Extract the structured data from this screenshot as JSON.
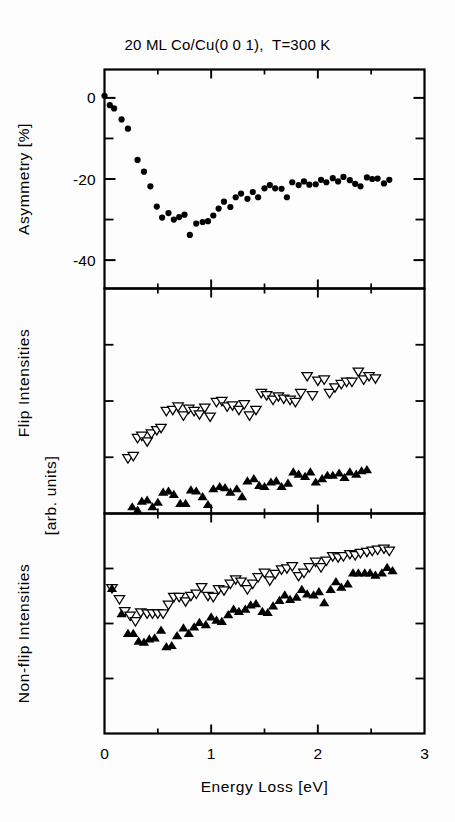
{
  "figure": {
    "title": "20 ML Co/Cu(0 0 1),  T=300 K",
    "xlabel": "Energy Loss [eV]"
  },
  "panels": {
    "top": {
      "ylabel": "Asymmetry [%]"
    },
    "middle": {
      "ylabel": "Flip Intensities"
    },
    "bottom": {
      "ylabel": "Non-flip Intensities",
      "ylabel2": "[arb. units]"
    }
  },
  "axis": {
    "x_ticks": [
      "0",
      "1",
      "2",
      "3"
    ],
    "y_ticks_top": [
      "0",
      "-20",
      "-40"
    ]
  },
  "chart_data": {
    "type": "scatter",
    "title": "20 ML Co/Cu(0 0 1),  T=300 K",
    "xlabel": "Energy Loss [eV]",
    "xlim": [
      0,
      3
    ],
    "xticks": [
      0,
      1,
      2,
      3
    ],
    "xminorticks": [
      0.5,
      1.5,
      2.5
    ],
    "grid": false,
    "legend": false,
    "panels": [
      {
        "name": "asymmetry",
        "ylabel": "Asymmetry [%]",
        "ylim": [
          -47,
          7
        ],
        "yticks": [
          0,
          -20,
          -40
        ],
        "yminorticks": [
          -10,
          -30
        ],
        "series": [
          {
            "name": "asymmetry",
            "marker": "filled-circle",
            "x": [
              0.0,
              0.05,
              0.09,
              0.16,
              0.22,
              0.31,
              0.37,
              0.43,
              0.49,
              0.54,
              0.6,
              0.65,
              0.7,
              0.75,
              0.8,
              0.86,
              0.92,
              0.97,
              1.02,
              1.07,
              1.12,
              1.18,
              1.23,
              1.28,
              1.34,
              1.39,
              1.44,
              1.5,
              1.55,
              1.6,
              1.66,
              1.71,
              1.76,
              1.82,
              1.87,
              1.92,
              1.98,
              2.03,
              2.08,
              2.14,
              2.19,
              2.24,
              2.3,
              2.35,
              2.4,
              2.46,
              2.51,
              2.56,
              2.62,
              2.67
            ],
            "y": [
              0.5,
              -1.8,
              -2.6,
              -5.3,
              -7.6,
              -15.3,
              -18.2,
              -21.8,
              -26.8,
              -29.5,
              -28.4,
              -30.0,
              -29.4,
              -28.8,
              -33.8,
              -31.0,
              -30.6,
              -30.4,
              -29.0,
              -27.3,
              -25.6,
              -26.9,
              -24.5,
              -23.6,
              -24.9,
              -23.2,
              -24.5,
              -22.3,
              -21.5,
              -22.3,
              -22.4,
              -24.5,
              -20.8,
              -21.5,
              -20.6,
              -21.4,
              -21.3,
              -20.2,
              -20.8,
              -19.8,
              -20.6,
              -19.5,
              -20.3,
              -21.2,
              -21.8,
              -19.6,
              -20.0,
              -19.9,
              -21.1,
              -20.2
            ]
          }
        ]
      },
      {
        "name": "flip_intensities",
        "ylabel": "Flip Intensities",
        "ylim": [
          0,
          10
        ],
        "yminorticks": [
          2.5,
          5.0,
          7.5
        ],
        "series": [
          {
            "name": "flip-open",
            "marker": "open-down-triangle",
            "x": [
              0.22,
              0.27,
              0.31,
              0.35,
              0.4,
              0.44,
              0.49,
              0.53,
              0.58,
              0.64,
              0.69,
              0.74,
              0.79,
              0.84,
              0.89,
              0.94,
              0.99,
              1.05,
              1.1,
              1.15,
              1.2,
              1.26,
              1.31,
              1.36,
              1.42,
              1.47,
              1.52,
              1.58,
              1.63,
              1.68,
              1.74,
              1.79,
              1.84,
              1.9,
              1.95,
              2.0,
              2.06,
              2.11,
              2.16,
              2.22,
              2.27,
              2.32,
              2.38,
              2.43,
              2.48,
              2.54,
              2.59,
              2.64
            ],
            "y": [
              2.45,
              2.55,
              3.35,
              3.45,
              3.2,
              3.55,
              3.7,
              3.8,
              4.55,
              4.6,
              4.75,
              4.35,
              4.65,
              4.55,
              4.4,
              4.7,
              4.3,
              4.95,
              5.0,
              4.75,
              4.8,
              4.6,
              4.85,
              4.35,
              4.6,
              5.35,
              5.25,
              5.05,
              5.2,
              5.1,
              5.05,
              4.95,
              5.35,
              6.1,
              5.25,
              5.9,
              5.95,
              5.35,
              5.6,
              5.75,
              5.85,
              5.85,
              6.3,
              5.95,
              6.1,
              6.0
            ]
          },
          {
            "name": "flip-filled",
            "marker": "filled-up-triangle",
            "x": [
              0.26,
              0.31,
              0.35,
              0.4,
              0.45,
              0.5,
              0.55,
              0.6,
              0.65,
              0.71,
              0.76,
              0.81,
              0.86,
              0.92,
              0.97,
              1.02,
              1.08,
              1.13,
              1.18,
              1.24,
              1.29,
              1.34,
              1.4,
              1.45,
              1.5,
              1.56,
              1.61,
              1.66,
              1.72,
              1.77,
              1.82,
              1.88,
              1.93,
              1.98,
              2.04,
              2.09,
              2.14,
              2.2,
              2.25,
              2.3,
              2.36,
              2.41,
              2.46,
              2.52,
              2.57,
              2.62,
              2.68
            ],
            "y": [
              0.3,
              0.15,
              0.55,
              0.6,
              0.3,
              0.5,
              0.95,
              1.0,
              0.85,
              0.45,
              0.45,
              1.05,
              1.0,
              0.75,
              0.4,
              1.1,
              1.2,
              1.15,
              0.95,
              1.1,
              0.75,
              1.45,
              1.55,
              1.25,
              1.2,
              1.4,
              1.45,
              1.2,
              1.35,
              1.85,
              1.75,
              1.65,
              1.85,
              1.4,
              1.55,
              1.7,
              1.7,
              1.8,
              1.6,
              1.85,
              1.75,
              1.9,
              1.95
            ]
          }
        ]
      },
      {
        "name": "nonflip_intensities",
        "ylabel": "Non-flip Intensities",
        "ylabel2": "[arb. units]",
        "ylim": [
          0,
          10
        ],
        "yminorticks": [
          2.5,
          5.0,
          7.5
        ],
        "series": [
          {
            "name": "nonflip-open",
            "marker": "open-down-triangle",
            "x": [
              0.07,
              0.14,
              0.19,
              0.24,
              0.29,
              0.34,
              0.4,
              0.45,
              0.5,
              0.55,
              0.6,
              0.65,
              0.7,
              0.76,
              0.81,
              0.86,
              0.91,
              0.97,
              1.02,
              1.07,
              1.12,
              1.18,
              1.23,
              1.28,
              1.34,
              1.39,
              1.44,
              1.5,
              1.55,
              1.6,
              1.66,
              1.71,
              1.76,
              1.82,
              1.87,
              1.92,
              1.98,
              2.03,
              2.08,
              2.14,
              2.19,
              2.24,
              2.3,
              2.35,
              2.4,
              2.46,
              2.51,
              2.56,
              2.62,
              2.67
            ],
            "y": [
              6.6,
              6.1,
              5.55,
              5.35,
              5.1,
              5.5,
              5.45,
              5.45,
              5.45,
              5.45,
              5.85,
              6.2,
              6.2,
              6.0,
              6.25,
              6.35,
              6.65,
              6.25,
              6.2,
              6.55,
              6.5,
              6.8,
              7.0,
              6.9,
              6.55,
              6.8,
              7.1,
              7.3,
              6.95,
              7.25,
              7.45,
              7.5,
              7.6,
              7.15,
              7.3,
              7.55,
              7.8,
              7.55,
              7.85,
              8.05,
              8.0,
              8.05,
              8.15,
              8.1,
              8.2,
              8.25,
              8.3,
              8.35,
              8.4,
              8.3
            ]
          },
          {
            "name": "nonflip-filled",
            "marker": "filled-up-triangle",
            "x": [
              0.07,
              0.16,
              0.22,
              0.27,
              0.32,
              0.37,
              0.42,
              0.47,
              0.53,
              0.58,
              0.63,
              0.68,
              0.74,
              0.79,
              0.84,
              0.89,
              0.95,
              1.0,
              1.05,
              1.1,
              1.16,
              1.21,
              1.26,
              1.32,
              1.37,
              1.42,
              1.48,
              1.53,
              1.58,
              1.64,
              1.69,
              1.74,
              1.8,
              1.85,
              1.9,
              1.96,
              2.01,
              2.06,
              2.12,
              2.17,
              2.22,
              2.28,
              2.33,
              2.38,
              2.44,
              2.49,
              2.54,
              2.6,
              2.65,
              2.7
            ],
            "y": [
              6.6,
              5.45,
              4.55,
              4.55,
              4.2,
              4.15,
              4.3,
              4.35,
              4.7,
              3.95,
              4.0,
              4.45,
              4.8,
              4.55,
              4.85,
              5.05,
              4.95,
              5.3,
              5.15,
              5.1,
              5.4,
              5.65,
              5.55,
              5.65,
              5.85,
              5.9,
              5.55,
              5.5,
              5.8,
              6.05,
              6.3,
              6.1,
              6.2,
              6.55,
              6.35,
              6.3,
              6.45,
              5.95,
              6.55,
              6.9,
              6.65,
              6.8,
              7.3,
              7.3,
              7.3,
              7.3,
              7.2,
              7.3,
              7.55,
              7.4
            ]
          }
        ]
      }
    ]
  }
}
